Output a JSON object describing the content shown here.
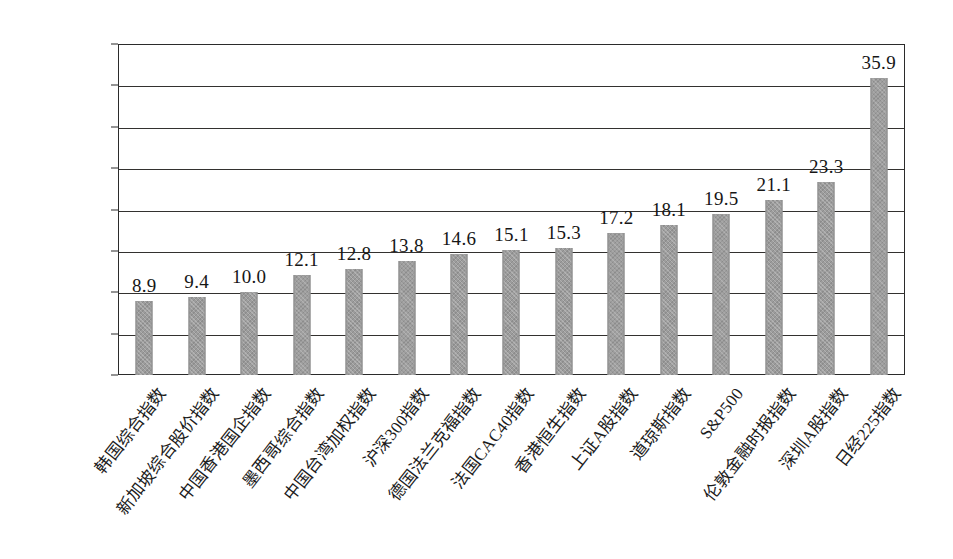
{
  "chart_data": {
    "type": "bar",
    "title": "",
    "xlabel": "",
    "ylabel": "",
    "ylim": [
      0,
      40
    ],
    "ytick_values": [
      40,
      35,
      30,
      25,
      20,
      15,
      10,
      5,
      0
    ],
    "ytick_labels": [
      "40",
      "35",
      "30",
      "25",
      "20",
      "15",
      "10",
      "5",
      "0"
    ],
    "grid": true,
    "legend": "none",
    "bar_color": "#9c9c9c",
    "categories": [
      "韩国综合指数",
      "新加坡综合股价指数",
      "中国香港国企指数",
      "墨西哥综合指数",
      "中国台湾加权指数",
      "沪深300指数",
      "德国法兰克福指数",
      "法国CAC40指数",
      "香港恒生指数",
      "上证A股指数",
      "道琼斯指数",
      "S&P500",
      "伦敦金融时报指数",
      "深圳A股指数",
      "日经225指数"
    ],
    "values": [
      8.9,
      9.4,
      10.0,
      12.1,
      12.8,
      13.8,
      14.6,
      15.1,
      15.3,
      17.2,
      18.1,
      19.5,
      21.1,
      23.3,
      35.9
    ],
    "value_labels": [
      "8.9",
      "9.4",
      "10.0",
      "12.1",
      "12.8",
      "13.8",
      "14.6",
      "15.1",
      "15.3",
      "17.2",
      "18.1",
      "19.5",
      "21.1",
      "23.3",
      "35.9"
    ]
  }
}
